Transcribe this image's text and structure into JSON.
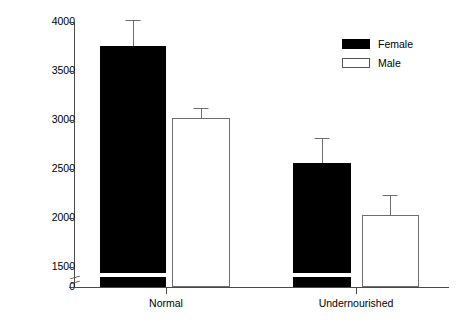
{
  "chart_data": {
    "type": "bar",
    "title": "",
    "xlabel": "",
    "ylabel": "Distance (cm)",
    "categories": [
      "Normal",
      "Undernourished"
    ],
    "series": [
      {
        "name": "Female",
        "color": "#000000",
        "values": [
          3780,
          2580
        ],
        "errors_upper": [
          4050,
          2830
        ]
      },
      {
        "name": "Male",
        "color": "#ffffff",
        "values": [
          2970,
          2040
        ],
        "errors_upper": [
          3070,
          2240
        ]
      }
    ],
    "ylim": [
      0,
      4000
    ],
    "yticks": [
      0,
      1500,
      2000,
      2500,
      3000,
      3500,
      4000
    ],
    "ytick_labels": [
      "0",
      "1500",
      "2000",
      "2500",
      "3000",
      "3500",
      "4000"
    ],
    "axis_break": {
      "present": true,
      "between": [
        0,
        1500
      ],
      "note": "y-axis broken between 0 and 1500"
    },
    "grid": false,
    "legend_position": "top-right",
    "error_bar_style": "upper-only"
  },
  "axis": {
    "y_label": "Distance (cm)",
    "ticks": [
      {
        "label": "4000",
        "top": 22
      },
      {
        "label": "3500",
        "top": 71
      },
      {
        "label": "3000",
        "top": 120
      },
      {
        "label": "2500",
        "top": 169
      },
      {
        "label": "2000",
        "top": 218
      },
      {
        "label": "1500",
        "top": 267
      },
      {
        "label": "0",
        "top": 287
      }
    ],
    "x_ticks": [
      {
        "label": "Normal",
        "left": 166
      },
      {
        "label": "Undernourished",
        "left": 356
      }
    ]
  },
  "bars": [
    {
      "name": "female-normal",
      "series": "Female",
      "category": "Normal",
      "left": 100,
      "width": 66,
      "top": 46,
      "height": 241,
      "fill": "female",
      "break_top": 273,
      "err_cap_top": 20,
      "err_center": 133
    },
    {
      "name": "male-normal",
      "series": "Male",
      "category": "Normal",
      "left": 172,
      "width": 58,
      "top": 118,
      "height": 169,
      "fill": "male",
      "break_top": null,
      "err_cap_top": 108,
      "err_center": 201
    },
    {
      "name": "female-undernourished",
      "series": "Female",
      "category": "Undernourished",
      "left": 293,
      "width": 58,
      "top": 163,
      "height": 124,
      "fill": "female",
      "break_top": 273,
      "err_cap_top": 138,
      "err_center": 322
    },
    {
      "name": "male-undernourished",
      "series": "Male",
      "category": "Undernourished",
      "left": 362,
      "width": 57,
      "top": 215,
      "height": 72,
      "fill": "male",
      "break_top": null,
      "err_cap_top": 195,
      "err_center": 390
    }
  ],
  "legend": {
    "items": [
      {
        "label": "Female",
        "swatch": "female"
      },
      {
        "label": "Male",
        "swatch": "male"
      }
    ]
  }
}
